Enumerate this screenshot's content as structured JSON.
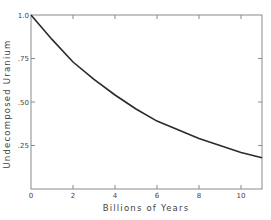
{
  "chart_data": {
    "type": "line",
    "title": "",
    "xlabel": "Billions of Years",
    "ylabel": "Undecomposed Uranium",
    "xlim": [
      0,
      11
    ],
    "ylim": [
      0,
      1.0
    ],
    "x_ticks": [
      0,
      2,
      4,
      6,
      8,
      10
    ],
    "x_tick_labels": [
      "0",
      "2",
      "4",
      "6",
      "8",
      "10"
    ],
    "y_ticks": [
      0.25,
      0.5,
      0.75,
      1.0
    ],
    "y_tick_labels": [
      ".25",
      ".50",
      ".75",
      "1.0"
    ],
    "grid": false,
    "legend": null,
    "series": [
      {
        "name": "Undecomposed Uranium",
        "x": [
          0,
          1,
          2,
          3,
          4,
          5,
          6,
          7,
          8,
          9,
          10,
          11
        ],
        "y": [
          1.0,
          0.86,
          0.73,
          0.63,
          0.54,
          0.46,
          0.39,
          0.34,
          0.29,
          0.25,
          0.21,
          0.18
        ]
      }
    ],
    "colors": {
      "line": "#2a2a2a",
      "frame": "#8a8a8a",
      "text": "#444444"
    }
  }
}
